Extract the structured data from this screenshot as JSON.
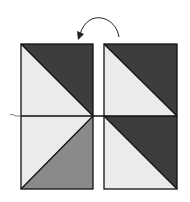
{
  "diagram": {
    "colors": {
      "dark": "#3d3d3d",
      "light": "#ebebeb",
      "medium": "#8a8a8a",
      "line": "#111111",
      "background": "#ffffff"
    },
    "left_unit": {
      "top_square": {
        "dark": "upper-right triangle",
        "light": "lower-left triangle"
      },
      "bottom_square": {
        "light": "upper-left triangle",
        "medium": "lower-right triangle"
      }
    },
    "right_unit": {
      "top_square": {
        "dark": "upper-right triangle",
        "light": "lower-left triangle"
      },
      "bottom_square": {
        "dark": "upper-right triangle",
        "light": "lower-left triangle"
      }
    },
    "arrow": {
      "direction": "counterclockwise",
      "meaning": "rotate right unit"
    },
    "seam_line": "horizontal stitching line across both units"
  }
}
